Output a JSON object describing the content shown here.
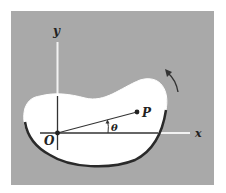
{
  "diagram": {
    "labels": {
      "x_axis": "x",
      "y_axis": "y",
      "origin": "O",
      "point": "P",
      "angle": "θ"
    },
    "colors": {
      "background": "#a9a9a9",
      "body_fill": "#ffffff",
      "outline": "#2a2a2a",
      "axis_on_gray": "#f2f2f2",
      "axis_on_body": "#333333"
    }
  }
}
